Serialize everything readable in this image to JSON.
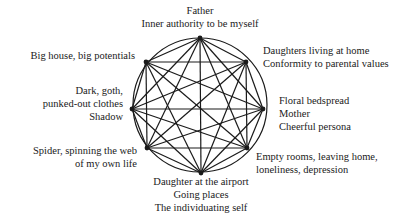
{
  "diagram": {
    "type": "complete-graph-in-circle",
    "circle": {
      "cx": 200,
      "cy": 105,
      "r": 67
    },
    "colors": {
      "line": "#1a1a1a",
      "text": "#1a1a1a",
      "background": "#ffffff"
    },
    "nodes": [
      {
        "id": "top",
        "x": 200,
        "y": 38,
        "lines": [
          "Father",
          "Inner authority to be myself"
        ]
      },
      {
        "id": "upper-right",
        "x": 246,
        "y": 62,
        "lines": [
          "Daughters living at home",
          "Conformity to parental values"
        ]
      },
      {
        "id": "right",
        "x": 263,
        "y": 109,
        "lines": [
          "Floral bedspread",
          "Mother",
          "Cheerful persona"
        ]
      },
      {
        "id": "lower-right",
        "x": 247,
        "y": 148,
        "lines": [
          "Empty rooms, leaving home,",
          "loneliness, depression"
        ]
      },
      {
        "id": "bottom",
        "x": 201,
        "y": 173,
        "lines": [
          "Daughter at the airport",
          "Going places",
          "The individuating self"
        ]
      },
      {
        "id": "lower-left",
        "x": 147,
        "y": 148,
        "lines": [
          "Spider, spinning the web",
          "of my own life"
        ]
      },
      {
        "id": "left",
        "x": 132,
        "y": 109,
        "lines": [
          "Dark, goth,",
          "punked-out clothes",
          "Shadow"
        ]
      },
      {
        "id": "upper-left",
        "x": 146,
        "y": 62,
        "lines": [
          "Big house, big potentials"
        ]
      }
    ]
  }
}
